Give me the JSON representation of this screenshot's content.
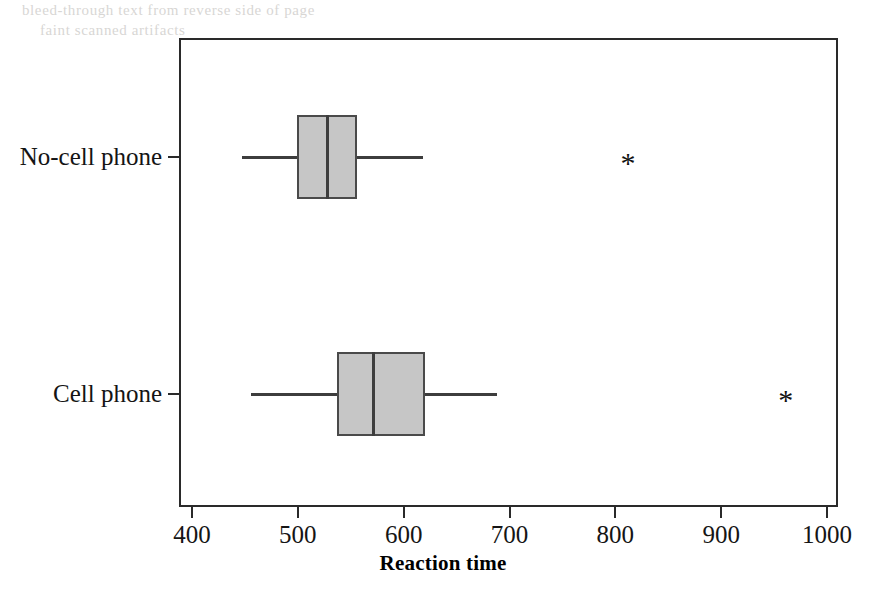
{
  "figure": {
    "background_color": "#ffffff",
    "frame_color": "#2a2a2a",
    "box_fill_color": "#c6c6c6",
    "box_edge_color": "#4a4a4a",
    "outlier_glyph": "*"
  },
  "axis": {
    "x_title": "Reaction time",
    "x_ticks": [
      "400",
      "500",
      "600",
      "700",
      "800",
      "900",
      "1000"
    ],
    "y_categories": [
      "No-cell phone",
      "Cell phone"
    ]
  },
  "bleed_through_text": {
    "top_line_1": "bleed-through text from reverse side of page",
    "top_line_2": "faint scanned artifacts"
  },
  "chart_data": {
    "type": "box",
    "title": "",
    "xlabel": "Reaction time",
    "ylabel": "",
    "xlim": [
      390,
      1010
    ],
    "grid": false,
    "orientation": "horizontal",
    "categories": [
      "No-cell phone",
      "Cell phone"
    ],
    "xticks": [
      400,
      500,
      600,
      700,
      800,
      900,
      1000
    ],
    "boxes": [
      {
        "label": "No-cell phone",
        "whisker_low": 447,
        "q1": 499,
        "median": 528,
        "q3": 556,
        "whisker_high": 618,
        "outliers": [
          812
        ]
      },
      {
        "label": "Cell phone",
        "whisker_low": 456,
        "q1": 537,
        "median": 571,
        "q3": 620,
        "whisker_high": 688,
        "outliers": [
          961
        ]
      }
    ]
  }
}
